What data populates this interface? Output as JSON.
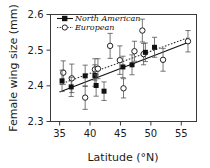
{
  "chart_data": {
    "type": "scatter",
    "title": "",
    "xlabel": "Latitude (°N)",
    "ylabel": "Female wing size (mm)",
    "xlim": [
      33.5,
      57.5
    ],
    "ylim": [
      2.3,
      2.6
    ],
    "xticks": [
      35,
      40,
      45,
      50,
      55
    ],
    "xtick_labels": [
      "35",
      "40",
      "45",
      "50",
      "55"
    ],
    "yticks": [
      2.3,
      2.4,
      2.5,
      2.6
    ],
    "ytick_labels": [
      "2.3",
      "2.4",
      "2.5",
      "2.6"
    ],
    "grid": false,
    "legend_position": "upper-left",
    "error_bars": "vertical",
    "series": [
      {
        "name": "North American",
        "marker": "filled-square",
        "line": "solid",
        "color": "#111111",
        "points": [
          {
            "x": 35.4,
            "y": 2.414,
            "err": 0.03
          },
          {
            "x": 36.9,
            "y": 2.397,
            "err": 0.027
          },
          {
            "x": 39.2,
            "y": 2.428,
            "err": 0.03
          },
          {
            "x": 40.8,
            "y": 2.429,
            "err": 0.03
          },
          {
            "x": 41.0,
            "y": 2.401,
            "err": 0.03
          },
          {
            "x": 42.3,
            "y": 2.385,
            "err": 0.026
          },
          {
            "x": 45.4,
            "y": 2.453,
            "err": 0.03
          },
          {
            "x": 46.9,
            "y": 2.459,
            "err": 0.028
          },
          {
            "x": 49.1,
            "y": 2.494,
            "err": 0.026
          },
          {
            "x": 50.6,
            "y": 2.508,
            "err": 0.028
          }
        ],
        "fit_line": {
          "x1": 35.0,
          "y1": 2.383,
          "x2": 56.3,
          "y2": 2.523
        }
      },
      {
        "name": "European",
        "marker": "open-circle",
        "line": "dotted",
        "color": "#333333",
        "points": [
          {
            "x": 35.6,
            "y": 2.437,
            "err": 0.033
          },
          {
            "x": 37.0,
            "y": 2.421,
            "err": 0.04
          },
          {
            "x": 39.2,
            "y": 2.367,
            "err": 0.033
          },
          {
            "x": 40.8,
            "y": 2.446,
            "err": 0.03
          },
          {
            "x": 41.3,
            "y": 2.448,
            "err": 0.028
          },
          {
            "x": 43.3,
            "y": 2.512,
            "err": 0.035
          },
          {
            "x": 44.9,
            "y": 2.472,
            "err": 0.04
          },
          {
            "x": 45.5,
            "y": 2.393,
            "err": 0.027
          },
          {
            "x": 47.3,
            "y": 2.497,
            "err": 0.028
          },
          {
            "x": 48.6,
            "y": 2.555,
            "err": 0.032
          },
          {
            "x": 48.8,
            "y": 2.489,
            "err": 0.03
          },
          {
            "x": 52.0,
            "y": 2.473,
            "err": 0.032
          },
          {
            "x": 56.1,
            "y": 2.525,
            "err": 0.03
          }
        ],
        "fit_line": {
          "x1": 35.0,
          "y1": 2.404,
          "x2": 56.3,
          "y2": 2.536
        }
      }
    ],
    "legend": [
      {
        "label": "North American",
        "marker": "filled-square",
        "line": "solid"
      },
      {
        "label": "European",
        "marker": "open-circle",
        "line": "dotted"
      }
    ]
  }
}
